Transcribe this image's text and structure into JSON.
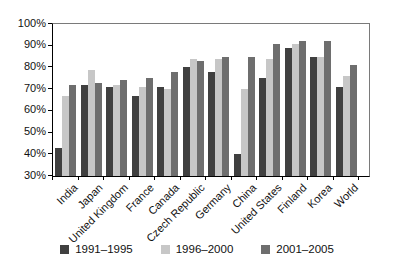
{
  "chart_data": {
    "type": "bar",
    "title": "",
    "xlabel": "",
    "ylabel": "",
    "categories": [
      "India",
      "Japan",
      "United Kingdom",
      "France",
      "Canada",
      "Czech Republic",
      "Germany",
      "China",
      "United States",
      "Finland",
      "Korea",
      "World"
    ],
    "series": [
      {
        "name": "1991–1995",
        "color": "#404040",
        "values": [
          43,
          72,
          71,
          67,
          71,
          80,
          78,
          40,
          75,
          89,
          85,
          71
        ]
      },
      {
        "name": "1996–2000",
        "color": "#c7c7c7",
        "values": [
          67,
          79,
          72,
          71,
          70,
          84,
          84,
          70,
          84,
          91,
          85,
          76
        ]
      },
      {
        "name": "2001–2005",
        "color": "#6e6e6e",
        "values": [
          72,
          73,
          74,
          75,
          78,
          83,
          85,
          85,
          91,
          92,
          92,
          81
        ]
      }
    ],
    "ylim": [
      30,
      100
    ],
    "ytick_step": 10,
    "ytick_labels": [
      "100%",
      "90%",
      "80%",
      "70%",
      "60%",
      "50%",
      "40%",
      "30%"
    ],
    "grid": false,
    "legend_position": "bottom",
    "axis_color": "#000000",
    "border_color": "#7a7a7a"
  }
}
